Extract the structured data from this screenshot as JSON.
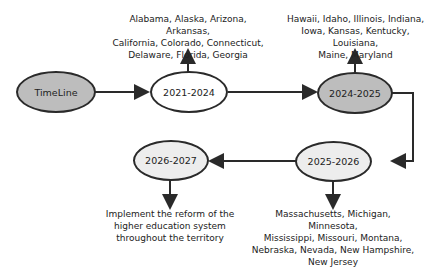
{
  "nodes": {
    "start": {
      "label": "TimeLine"
    },
    "n1": {
      "label": "2021-2024"
    },
    "n2": {
      "label": "2024-2025"
    },
    "n3": {
      "label": "2025-2026"
    },
    "n4": {
      "label": "2026-2027"
    }
  },
  "notes": {
    "n1": [
      "Alabama, Alaska, Arizona, Arkansas,",
      "California, Colorado, Connecticut,",
      "Delaware, Florida, Georgia"
    ],
    "n2": [
      "Hawaii, Idaho, Illinois, Indiana,",
      "Iowa, Kansas, Kentucky, Louisiana,",
      "Maine, Maryland"
    ],
    "n3": [
      "Massachusetts, Michigan, Minnesota,",
      "Mississippi, Missouri, Montana,",
      "Nebraska, Nevada, New Hampshire,",
      "New Jersey"
    ],
    "n4": [
      "Implement the reform of the",
      "higher education system",
      "throughout the territory"
    ]
  },
  "colors": {
    "start_fill": "#bdbdbd",
    "n2_fill": "#bdbdbd",
    "n3_fill": "#ededed",
    "n4_fill": "#ededed",
    "stroke": "#2a2a2a"
  }
}
